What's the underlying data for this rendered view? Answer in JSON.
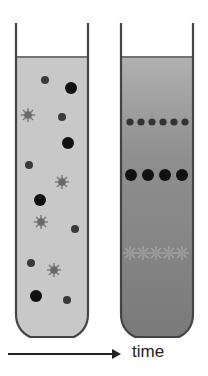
{
  "figure": {
    "arrow_label": "time",
    "tubes": [
      {
        "id": "before",
        "description": "Mixed particles suspended uniformly",
        "liquid_color": "#c9c9c9",
        "particles": [
          {
            "type": "small-dot",
            "x": 45,
            "y": 80
          },
          {
            "type": "large-dot",
            "x": 71,
            "y": 88
          },
          {
            "type": "star",
            "x": 28,
            "y": 115
          },
          {
            "type": "small-dot",
            "x": 62,
            "y": 117
          },
          {
            "type": "large-dot",
            "x": 68,
            "y": 143
          },
          {
            "type": "small-dot",
            "x": 29,
            "y": 165
          },
          {
            "type": "star",
            "x": 62,
            "y": 182
          },
          {
            "type": "large-dot",
            "x": 40,
            "y": 200
          },
          {
            "type": "star",
            "x": 41,
            "y": 222
          },
          {
            "type": "small-dot",
            "x": 75,
            "y": 229
          },
          {
            "type": "small-dot",
            "x": 31,
            "y": 263
          },
          {
            "type": "star",
            "x": 54,
            "y": 270
          },
          {
            "type": "large-dot",
            "x": 36,
            "y": 296
          },
          {
            "type": "small-dot",
            "x": 67,
            "y": 300
          }
        ]
      },
      {
        "id": "after",
        "description": "Particles separated into bands",
        "liquid_color": "#8a8a8a",
        "bands": [
          {
            "type": "small-dot",
            "y": 122,
            "count": 6
          },
          {
            "type": "large-dot",
            "y": 175,
            "count": 4
          },
          {
            "type": "star",
            "y": 253,
            "count": 5
          }
        ]
      }
    ],
    "colors": {
      "outline": "#444444",
      "large_dot": "#111111",
      "small_dot": "#3a3a3a",
      "star": "#6e6e6e",
      "arrow": "#222222"
    }
  }
}
